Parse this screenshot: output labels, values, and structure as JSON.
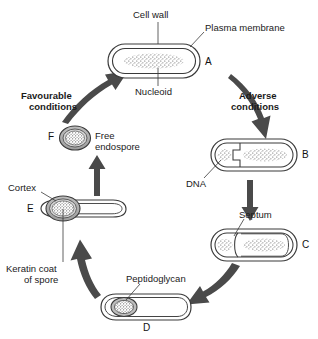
{
  "figure": {
    "background_color": "#ffffff",
    "line_color": "#3a3a3a",
    "arrow_color": "#4a4a4a",
    "text_color": "#1a1a1a"
  },
  "annotations": {
    "cell_wall": "Cell wall",
    "plasma_membrane": "Plasma membrane",
    "nucleoid": "Nucleoid",
    "dna": "DNA",
    "septum": "Septum",
    "peptidoglycan": "Peptidoglycan",
    "cortex": "Cortex",
    "keratin_coat_line1": "Keratin coat",
    "keratin_coat_line2": "of spore",
    "free_endospore_line1": "Free",
    "free_endospore_line2": "endospore"
  },
  "conditions": {
    "favourable_line1": "Favourable",
    "favourable_line2": "conditions",
    "adverse_line1": "Adverse",
    "adverse_line2": "conditions"
  },
  "stages": [
    {
      "id": "A",
      "label": "A",
      "description": "Vegetative cell with nucleoid"
    },
    {
      "id": "B",
      "label": "B",
      "description": "DNA replication and membrane invagination"
    },
    {
      "id": "C",
      "label": "C",
      "description": "Septum formation completed"
    },
    {
      "id": "D",
      "label": "D",
      "description": "Forespore engulfed, peptidoglycan cortex deposited"
    },
    {
      "id": "E",
      "label": "E",
      "description": "Spore coat formed, mother cell lysing"
    },
    {
      "id": "F",
      "label": "F",
      "description": "Free mature endospore released"
    }
  ]
}
